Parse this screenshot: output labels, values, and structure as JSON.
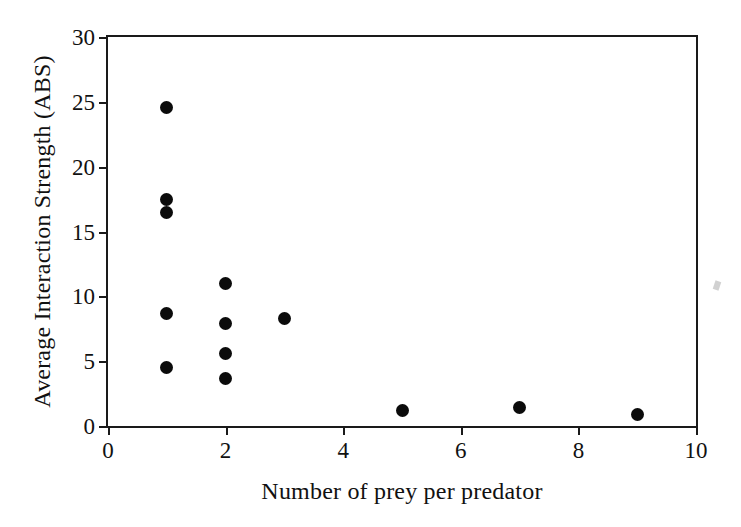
{
  "chart_data": {
    "type": "scatter",
    "title": "",
    "xlabel": "Number of prey per predator",
    "ylabel": "Average Interaction Strength (ABS)",
    "xlim": [
      0,
      10
    ],
    "ylim": [
      0,
      30
    ],
    "xticks": [
      "0",
      "2",
      "4",
      "6",
      "8",
      "10"
    ],
    "xtick_values": [
      0,
      2,
      4,
      6,
      8,
      10
    ],
    "yticks": [
      "0",
      "5",
      "10",
      "15",
      "20",
      "25",
      "30"
    ],
    "ytick_values": [
      0,
      5,
      10,
      15,
      20,
      25,
      30
    ],
    "grid": false,
    "legend": null,
    "marker": "filled-circle",
    "marker_color": "#0b0b0b",
    "points": [
      {
        "x": 1,
        "y": 24.6
      },
      {
        "x": 1,
        "y": 17.5
      },
      {
        "x": 1,
        "y": 16.5
      },
      {
        "x": 1,
        "y": 8.7
      },
      {
        "x": 1,
        "y": 4.5
      },
      {
        "x": 2,
        "y": 11.0
      },
      {
        "x": 2,
        "y": 7.9
      },
      {
        "x": 2,
        "y": 5.6
      },
      {
        "x": 2,
        "y": 3.7
      },
      {
        "x": 3,
        "y": 8.3
      },
      {
        "x": 5,
        "y": 1.2
      },
      {
        "x": 7,
        "y": 1.4
      },
      {
        "x": 9,
        "y": 0.9
      }
    ]
  }
}
